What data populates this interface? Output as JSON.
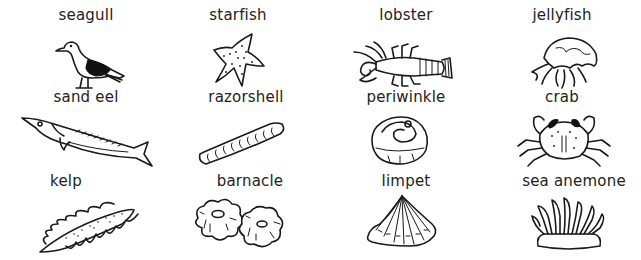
{
  "worksheet": {
    "items": [
      {
        "label": "seagull",
        "icon": "seagull-drawing"
      },
      {
        "label": "starfish",
        "icon": "starfish-drawing"
      },
      {
        "label": "lobster",
        "icon": "lobster-drawing"
      },
      {
        "label": "jellyfish",
        "icon": "jellyfish-drawing"
      },
      {
        "label": "sand eel",
        "icon": "sand-eel-drawing"
      },
      {
        "label": "razorshell",
        "icon": "razorshell-drawing"
      },
      {
        "label": "periwinkle",
        "icon": "periwinkle-drawing"
      },
      {
        "label": "crab",
        "icon": "crab-drawing"
      },
      {
        "label": "kelp",
        "icon": "kelp-drawing"
      },
      {
        "label": "barnacle",
        "icon": "barnacle-drawing"
      },
      {
        "label": "limpet",
        "icon": "limpet-drawing"
      },
      {
        "label": "sea anemone",
        "icon": "sea-anemone-drawing"
      }
    ],
    "colors": {
      "ink": "#1a1a1a",
      "background": "#ffffff"
    }
  }
}
